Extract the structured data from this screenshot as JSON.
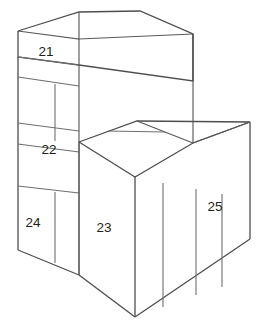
{
  "figure": {
    "type": "line-drawing",
    "background_color": "#ffffff",
    "line_color": "#58595b",
    "label_color": "#231f20",
    "labels": [
      {
        "id": "label-21",
        "text": "21",
        "x": 46,
        "y": 52,
        "face": "upper-block-left-face"
      },
      {
        "id": "label-22",
        "text": "22",
        "x": 49,
        "y": 150,
        "face": "middle-left-face"
      },
      {
        "id": "label-23",
        "text": "23",
        "x": 104,
        "y": 228,
        "face": "lower-front-face"
      },
      {
        "id": "label-24",
        "text": "24",
        "x": 33,
        "y": 223,
        "face": "bottom-left-face"
      },
      {
        "id": "label-25",
        "text": "25",
        "x": 215,
        "y": 207,
        "face": "right-block-face"
      }
    ]
  },
  "geometry": {
    "upper_block": {
      "top_face": "18,31 79,12 140,11 193,34",
      "front_band": "18,31 18,57 79,65 79,39",
      "right_band": "79,39 79,65 193,81 193,34"
    },
    "left_column": {
      "outline": "18,57 18,250 79,275 79,65",
      "dividers": [
        "18,77 79,86",
        "18,123 79,131",
        "18,144 79,152",
        "18,186 79,193",
        "55,86 55,140",
        "55,193 55,262"
      ]
    },
    "middle_step": {
      "top_face": "79,142 137,121 250,122 193,143",
      "top_dividers": [
        "108,131 165,132",
        "137,121 193,143"
      ],
      "front_face": "79,142 79,275 135,317 135,177",
      "right_face": "135,177 135,317 250,239 250,122",
      "right_dividers": [
        "163,183 163,307",
        "196,189 196,296",
        "222,194 222,287"
      ]
    },
    "tall_back_edge": "193,34 193,143"
  },
  "colors": {
    "stroke": "#58595b",
    "stroke_outer": "#4d4e50",
    "divider": "#6d6e71",
    "fill": "#ffffff",
    "text": "#231f20"
  }
}
